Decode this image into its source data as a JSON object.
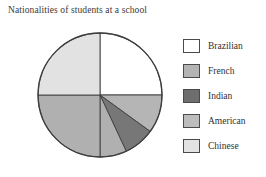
{
  "chart_data": {
    "type": "pie",
    "title": "Nationalities of students at a school",
    "xlabel": "",
    "ylabel": "",
    "legend_position": "right",
    "grid": false,
    "categories": [
      "Brazilian",
      "French",
      "Indian",
      "American",
      "Chinese"
    ],
    "values": [
      25,
      10,
      8,
      32,
      25
    ],
    "units": "percent",
    "start_angle_deg": 0,
    "direction": "clockwise",
    "slices": [
      {
        "label": "Brazilian",
        "value": 25,
        "start_deg": 0,
        "end_deg": 90,
        "color": "#ffffff"
      },
      {
        "label": "French",
        "value": 10,
        "start_deg": 90,
        "end_deg": 126,
        "color": "#b5b5b5"
      },
      {
        "label": "Indian",
        "value": 8,
        "start_deg": 126,
        "end_deg": 155,
        "color": "#777777"
      },
      {
        "label": "American",
        "value": 7,
        "start_deg": 155,
        "end_deg": 180,
        "color": "#b0b0b0"
      },
      {
        "label": "Chinese",
        "value": 25,
        "start_deg": 180,
        "end_deg": 270,
        "color": "#b0b0b0"
      },
      {
        "label": "Chinese",
        "value": 25,
        "start_deg": 270,
        "end_deg": 360,
        "color": "#e2e2e2"
      }
    ],
    "outline_color": "#3d3d3d"
  },
  "title": "Nationalities of students at a school",
  "legend": {
    "items": [
      {
        "label": "Brazilian",
        "color": "#ffffff"
      },
      {
        "label": "French",
        "color": "#b4b4b4"
      },
      {
        "label": "Indian",
        "color": "#6e6e6e"
      },
      {
        "label": "American",
        "color": "#bdbdbd"
      },
      {
        "label": "Chinese",
        "color": "#e3e3e3"
      }
    ]
  }
}
